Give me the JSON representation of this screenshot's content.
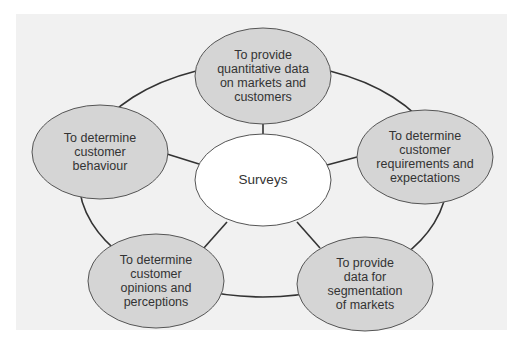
{
  "diagram": {
    "type": "hub-and-spoke",
    "colors": {
      "panel_background": "#f1f1f1",
      "outer_node_fill": "#d5d5d5",
      "center_node_fill": "#ffffff",
      "node_outline": "#555555",
      "connector": "#333333",
      "text": "#333333"
    },
    "center": {
      "label": "Surveys"
    },
    "nodes": [
      {
        "id": "top",
        "label": "To provide\nquantitative data\non markets and\ncustomers"
      },
      {
        "id": "right",
        "label": "To determine\ncustomer\nrequirements and\nexpectations"
      },
      {
        "id": "bottom-right",
        "label": "To provide\ndata for\nsegmentation\nof markets"
      },
      {
        "id": "bottom-left",
        "label": "To determine\ncustomer\nopinions and\nperceptions"
      },
      {
        "id": "left",
        "label": "To determine\ncustomer\nbehaviour"
      }
    ]
  }
}
